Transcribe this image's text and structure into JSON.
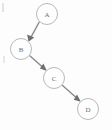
{
  "figure": {
    "kind": "directed-graph-diagram",
    "title": "",
    "background_color": "#fdfdfd",
    "node_stroke_color": "#b9b9b9",
    "node_fill_color": "#fefefe",
    "label_color": "#6d6d6d",
    "edge_color": "#8a8a8a",
    "arrowhead_color": "#6f6f6f",
    "width": 112,
    "height": 130
  },
  "nodes": [
    {
      "id": "A",
      "label": "A",
      "cx": 47,
      "cy": 14,
      "r": 10.5
    },
    {
      "id": "B",
      "label": "B",
      "cx": 21,
      "cy": 49,
      "r": 10.5
    },
    {
      "id": "C",
      "label": "C",
      "cx": 54,
      "cy": 78,
      "r": 10.5
    },
    {
      "id": "D",
      "label": "D",
      "cx": 88,
      "cy": 109,
      "r": 10.5
    }
  ],
  "edges": [
    {
      "id": "A-B",
      "from": "A",
      "to": "B",
      "directed": true,
      "label": "",
      "x1": 39.5,
      "y1": 21.5,
      "x2": 28.5,
      "y2": 41.5
    },
    {
      "id": "B-C",
      "from": "B",
      "to": "C",
      "directed": true,
      "label": "",
      "x1": 29.5,
      "y1": 55.5,
      "x2": 46.5,
      "y2": 70.5
    },
    {
      "id": "C-D",
      "from": "C",
      "to": "D",
      "directed": true,
      "label": "",
      "x1": 62.0,
      "y1": 85.0,
      "x2": 80.5,
      "y2": 101.5
    }
  ],
  "artifacts": [
    {
      "id": "left-edge-mark-top",
      "x": 2,
      "y": 3,
      "width": 2,
      "height": 9
    },
    {
      "id": "left-edge-mark-middle",
      "x": 3,
      "y": 56,
      "width": 2,
      "height": 7
    }
  ]
}
